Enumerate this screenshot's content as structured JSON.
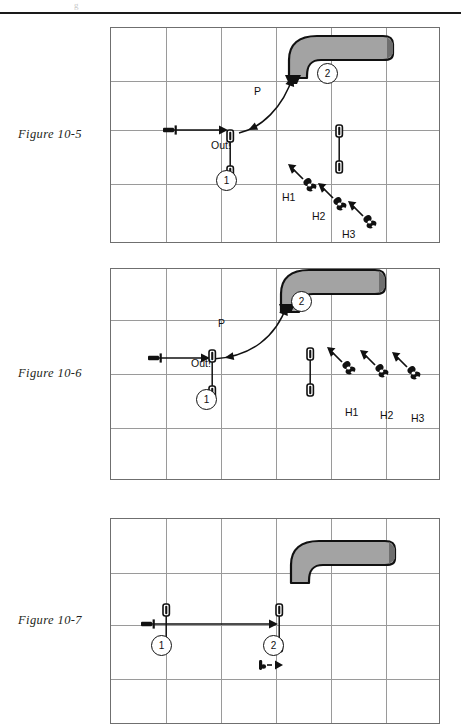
{
  "page": {
    "top_rule": true,
    "ghost_text": "g"
  },
  "figures": [
    {
      "id": "figure-10-5",
      "label": "Figure 10-5",
      "panel": {
        "x": 110,
        "y": 27,
        "w": 330,
        "h": 216
      },
      "grid": {
        "cols": 6,
        "rows": 4,
        "vlines": [
          165,
          220,
          275,
          330,
          385
        ],
        "hlines": [
          80,
          129,
          183
        ]
      },
      "annotations": [
        {
          "name": "label-P",
          "text": "P",
          "x": 143,
          "y": 57
        },
        {
          "name": "label-out",
          "text": "Out!",
          "x": 100,
          "y": 111
        },
        {
          "name": "route-marker-1",
          "text": "1",
          "x": 105,
          "y": 142
        },
        {
          "name": "route-marker-2",
          "text": "2",
          "x": 206,
          "y": 35
        },
        {
          "name": "defender-label-h1",
          "text": "H1",
          "x": 171,
          "y": 163
        },
        {
          "name": "defender-label-h2",
          "text": "H2",
          "x": 201,
          "y": 182
        },
        {
          "name": "defender-label-h3",
          "text": "H3",
          "x": 231,
          "y": 200
        }
      ],
      "goalposts": [
        {
          "name": "goalpost-near",
          "x": 116,
          "y": 102
        },
        {
          "name": "goalpost-far",
          "x": 225,
          "y": 97
        }
      ],
      "defenders": [
        {
          "name": "defender-h1",
          "x": 194,
          "y": 153,
          "angle": -45
        },
        {
          "name": "defender-h2",
          "x": 224,
          "y": 172,
          "angle": -45
        },
        {
          "name": "defender-h3",
          "x": 254,
          "y": 190,
          "angle": -45
        }
      ],
      "ball_start": {
        "name": "ball-start-marker",
        "x": 52,
        "y": 102
      },
      "runner_arrow": {
        "name": "runner-straight-arrow",
        "x1": 58,
        "y1": 102,
        "x2": 117,
        "y2": 102
      },
      "route_curve": {
        "name": "route-curve-arrow",
        "path": "M 128 105 C 150 100 172 80 182 48"
      },
      "pipe": {
        "name": "pipe-shape",
        "x": 176,
        "y": 6
      }
    },
    {
      "id": "figure-10-6",
      "label": "Figure 10-6",
      "panel": {
        "x": 110,
        "y": 268,
        "w": 330,
        "h": 212
      },
      "grid": {
        "cols": 6,
        "rows": 4,
        "vlines": [
          165,
          220,
          275,
          330,
          385
        ],
        "hlines": [
          319,
          373,
          427
        ]
      },
      "annotations": [
        {
          "name": "label-P",
          "text": "P",
          "x": 107,
          "y": 48
        },
        {
          "name": "label-out",
          "text": "Out!",
          "x": 80,
          "y": 88
        },
        {
          "name": "route-marker-1",
          "text": "1",
          "x": 85,
          "y": 120
        },
        {
          "name": "route-marker-2",
          "text": "2",
          "x": 180,
          "y": 22
        },
        {
          "name": "defender-label-h1",
          "text": "H1",
          "x": 234,
          "y": 137
        },
        {
          "name": "defender-label-h2",
          "text": "H2",
          "x": 269,
          "y": 140
        },
        {
          "name": "defender-label-h3",
          "text": "H3",
          "x": 300,
          "y": 143
        }
      ],
      "goalposts": [
        {
          "name": "goalpost-near",
          "x": 98,
          "y": 81
        },
        {
          "name": "goalpost-far",
          "x": 196,
          "y": 79
        }
      ],
      "defenders": [
        {
          "name": "defender-h1",
          "x": 233,
          "y": 95,
          "angle": -45
        },
        {
          "name": "defender-h2",
          "x": 266,
          "y": 98,
          "angle": -45
        },
        {
          "name": "defender-h3",
          "x": 298,
          "y": 100,
          "angle": -45
        }
      ],
      "ball_start": {
        "name": "ball-start-marker",
        "x": 37,
        "y": 89
      },
      "runner_arrow": {
        "name": "runner-straight-arrow",
        "x1": 44,
        "y1": 89,
        "x2": 99,
        "y2": 89
      },
      "route_curve": {
        "name": "route-curve-arrow",
        "path": "M 102 90 C 140 88 165 68 176 36"
      },
      "pipe": {
        "name": "pipe-shape",
        "x": 168,
        "y": -1
      }
    },
    {
      "id": "figure-10-7",
      "label": "Figure 10-7",
      "panel": {
        "x": 110,
        "y": 518,
        "w": 330,
        "h": 206
      },
      "grid": {
        "cols": 6,
        "rows": 4,
        "vlines": [
          165,
          220,
          275,
          330,
          385
        ],
        "hlines": [
          572,
          624,
          678
        ]
      },
      "annotations": [
        {
          "name": "route-marker-1",
          "text": "1",
          "x": 40,
          "y": 116
        },
        {
          "name": "route-marker-2",
          "text": "2",
          "x": 152,
          "y": 116
        }
      ],
      "goalposts": [
        {
          "name": "goalpost-near",
          "x": 52,
          "y": 85
        },
        {
          "name": "goalpost-far",
          "x": 165,
          "y": 85
        }
      ],
      "ball_start": {
        "name": "ball-start-marker",
        "x": 30,
        "y": 105
      },
      "runner_arrow": {
        "name": "runner-straight-arrow",
        "x1": 36,
        "y1": 105,
        "x2": 167,
        "y2": 105
      },
      "coach_marker": {
        "name": "coach-marker",
        "x": 148,
        "y": 146
      },
      "pipe": {
        "name": "pipe-shape",
        "x": 178,
        "y": 20
      }
    }
  ],
  "colors": {
    "pipe_fill": "#a3a3a3",
    "outline": "#111111",
    "grid": "#9a9a9a",
    "panel_border": "#6f6f6f",
    "text": "#231f20"
  }
}
